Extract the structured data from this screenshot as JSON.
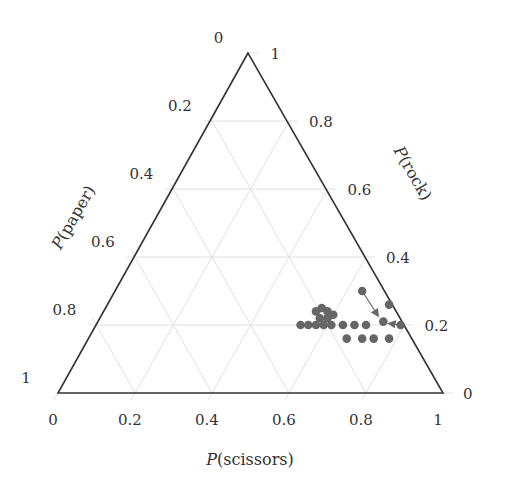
{
  "chart_data": {
    "type": "scatter",
    "subtype": "ternary",
    "title": "",
    "axes": {
      "bottom": {
        "label_prefix": "P",
        "label_var": "scissors",
        "label": "P(scissors)",
        "ticks": [
          "0",
          "0.2",
          "0.4",
          "0.6",
          "0.8",
          "1"
        ]
      },
      "right": {
        "label_prefix": "P",
        "label_var": "rock",
        "label": "P(rock)",
        "ticks": [
          "0",
          "0.2",
          "0.4",
          "0.6",
          "0.8",
          "1"
        ]
      },
      "left": {
        "label_prefix": "P",
        "label_var": "paper",
        "label": "P(paper)",
        "ticks": [
          "0",
          "0.2",
          "0.4",
          "0.6",
          "0.8",
          "1"
        ]
      }
    },
    "grid": true,
    "grid_step": 0.2,
    "colors": {
      "frame": "#333333",
      "grid": "#d8d8d8",
      "points": "#666666",
      "tick_text": "#333333"
    },
    "points": [
      {
        "scissors": 0.53,
        "rock": 0.2
      },
      {
        "scissors": 0.55,
        "rock": 0.2
      },
      {
        "scissors": 0.57,
        "rock": 0.2
      },
      {
        "scissors": 0.59,
        "rock": 0.2
      },
      {
        "scissors": 0.61,
        "rock": 0.2
      },
      {
        "scissors": 0.64,
        "rock": 0.2
      },
      {
        "scissors": 0.67,
        "rock": 0.2
      },
      {
        "scissors": 0.7,
        "rock": 0.2
      },
      {
        "scissors": 0.55,
        "rock": 0.24
      },
      {
        "scissors": 0.56,
        "rock": 0.25
      },
      {
        "scissors": 0.58,
        "rock": 0.24
      },
      {
        "scissors": 0.57,
        "rock": 0.22
      },
      {
        "scissors": 0.59,
        "rock": 0.22
      },
      {
        "scissors": 0.6,
        "rock": 0.23
      },
      {
        "scissors": 0.67,
        "rock": 0.16
      },
      {
        "scissors": 0.71,
        "rock": 0.16
      },
      {
        "scissors": 0.74,
        "rock": 0.16
      },
      {
        "scissors": 0.78,
        "rock": 0.16
      },
      {
        "scissors": 0.64,
        "rock": 0.3
      },
      {
        "scissors": 0.73,
        "rock": 0.26
      },
      {
        "scissors": 0.74,
        "rock": 0.21
      },
      {
        "scissors": 0.79,
        "rock": 0.2
      }
    ],
    "arrows": [
      {
        "from": {
          "scissors": 0.64,
          "rock": 0.3
        },
        "to": {
          "scissors": 0.72,
          "rock": 0.225
        }
      },
      {
        "from": {
          "scissors": 0.79,
          "rock": 0.2
        },
        "to": {
          "scissors": 0.755,
          "rock": 0.205
        }
      }
    ]
  }
}
